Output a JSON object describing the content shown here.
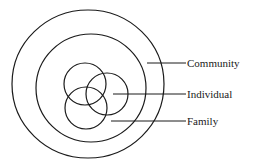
{
  "diagram": {
    "type": "nested-circles",
    "colors": {
      "stroke": "#1a1a1a",
      "background": "#ffffff"
    },
    "labels": {
      "community": "Community",
      "individual": "Individual",
      "family": "Family"
    },
    "structure": {
      "outer_circle": "Community",
      "inner_circle": "Family",
      "overlapping_circles": [
        "Individual",
        "Individual",
        "Individual"
      ]
    }
  }
}
